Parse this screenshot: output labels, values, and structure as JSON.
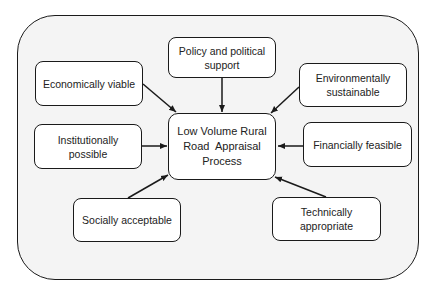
{
  "diagram": {
    "center": {
      "id": "center",
      "label": "Low Volume Rural Road  Appraisal Process"
    },
    "nodes": [
      {
        "id": "policy",
        "label": "Policy and political support"
      },
      {
        "id": "economic",
        "label": "Economically viable"
      },
      {
        "id": "environment",
        "label": "Environmentally sustainable"
      },
      {
        "id": "institutional",
        "label": "Institutionally possible"
      },
      {
        "id": "financial",
        "label": "Financially feasible"
      },
      {
        "id": "social",
        "label": "Socially acceptable"
      },
      {
        "id": "technical",
        "label": "Technically appropriate"
      }
    ],
    "edges": [
      {
        "from": "policy",
        "to": "center"
      },
      {
        "from": "economic",
        "to": "center"
      },
      {
        "from": "environment",
        "to": "center"
      },
      {
        "from": "institutional",
        "to": "center"
      },
      {
        "from": "financial",
        "to": "center"
      },
      {
        "from": "social",
        "to": "center"
      },
      {
        "from": "technical",
        "to": "center"
      }
    ],
    "colors": {
      "frame_bg": "#f4f4f4",
      "box_bg": "#ffffff",
      "stroke": "#1a1a1a"
    }
  }
}
